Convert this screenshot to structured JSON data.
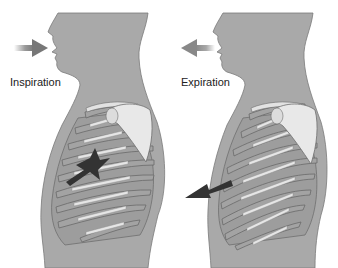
{
  "figures": [
    {
      "id": "inspiration",
      "label": "Inspiration",
      "air_arrow_direction": "inward",
      "chest_arrow_direction": "inward",
      "ribs": "elevated"
    },
    {
      "id": "expiration",
      "label": "Expiration",
      "air_arrow_direction": "outward",
      "chest_arrow_direction": "outward",
      "ribs": "depressed"
    }
  ],
  "colors": {
    "background": "#ffffff",
    "body": "#a9a9a9",
    "body_outline": "#6e6e6e",
    "rib_fill": "#9a9a9a",
    "rib_cartilage": "#e6e6e6",
    "scapula": "#e8e8e8",
    "air_arrow": "#8a8a8a",
    "chest_arrow": "#3a3a3a",
    "label_text": "#222222"
  }
}
